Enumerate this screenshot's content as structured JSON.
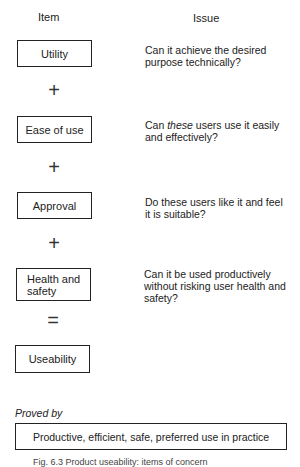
{
  "headers": {
    "item": "Item",
    "issue": "Issue"
  },
  "rows": [
    {
      "item": "Utility",
      "issue": "Can it achieve the desired purpose technically?"
    },
    {
      "item": "Ease of use",
      "issue_em": "these",
      "issue_pre": "Can ",
      "issue_post": " users use it easily and effectively?"
    },
    {
      "item": "Approval",
      "issue": "Do these users like it and feel it is suitable?"
    },
    {
      "item_line1": "Health and",
      "item_line2": "safety",
      "issue": "Can it be used productively without risking user health and safety?"
    }
  ],
  "operators": {
    "plus": "+",
    "equals": "="
  },
  "result": {
    "item": "Useability"
  },
  "proved_by": {
    "label": "Proved by",
    "text": "Productive, efficient, safe, preferred use in practice"
  },
  "caption": "Fig. 6.3  Product useability: items of concern"
}
